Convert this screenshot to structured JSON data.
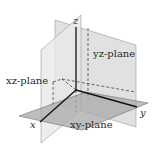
{
  "diagram": {
    "axes": [
      {
        "name": "x",
        "label": "x"
      },
      {
        "name": "y",
        "label": "y"
      },
      {
        "name": "z",
        "label": "z"
      }
    ],
    "planes": [
      {
        "name": "yz-plane",
        "label": "yz-plane",
        "color": "#d9d9d9"
      },
      {
        "name": "xz-plane",
        "label": "xz-plane",
        "color": "#e6e6e6"
      },
      {
        "name": "xy-plane",
        "label": "xy-plane",
        "color": "#a9a9a9"
      }
    ],
    "colors": {
      "background": "#ffffff",
      "axis": "#111111",
      "plane_edge": "#8a8a8a",
      "hidden_line": "#444444"
    }
  }
}
